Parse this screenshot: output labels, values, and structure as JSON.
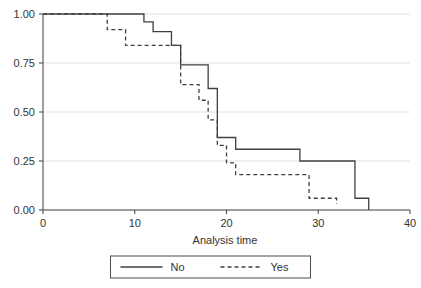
{
  "chart_data": {
    "type": "line",
    "subtype": "kaplan-meier-step",
    "title": "",
    "xlabel": "Analysis time",
    "ylabel": "",
    "xlim": [
      0,
      40
    ],
    "ylim": [
      0,
      1
    ],
    "xticks": [
      0,
      10,
      20,
      30,
      40
    ],
    "xticklabels": [
      "0",
      "10",
      "20",
      "30",
      "40"
    ],
    "yticks": [
      0.0,
      0.25,
      0.5,
      0.75,
      1.0
    ],
    "yticklabels": [
      "0.00",
      "0.25",
      "0.50",
      "0.75",
      "1.00"
    ],
    "grid": "horizontal",
    "legend_position": "below-center",
    "legend_entries": [
      "No",
      "Yes"
    ],
    "series": [
      {
        "name": "No",
        "style": "solid",
        "color": "#404040",
        "x": [
          0,
          11,
          12,
          14,
          15,
          18,
          19,
          21,
          28,
          34,
          35,
          35.5
        ],
        "y": [
          1.0,
          1.0,
          0.96,
          0.91,
          0.84,
          0.74,
          0.62,
          0.37,
          0.31,
          0.25,
          0.06,
          0.0
        ],
        "steps": [
          {
            "time": 0,
            "survival": 1.0
          },
          {
            "time": 11,
            "survival": 0.96
          },
          {
            "time": 12,
            "survival": 0.91
          },
          {
            "time": 14,
            "survival": 0.84
          },
          {
            "time": 15,
            "survival": 0.74
          },
          {
            "time": 18,
            "survival": 0.62
          },
          {
            "time": 19,
            "survival": 0.37
          },
          {
            "time": 21,
            "survival": 0.31
          },
          {
            "time": 28,
            "survival": 0.25
          },
          {
            "time": 34,
            "survival": 0.06
          },
          {
            "time": 35.5,
            "survival": 0.0
          }
        ]
      },
      {
        "name": "Yes",
        "style": "dashed",
        "color": "#404040",
        "x": [
          0,
          7,
          9,
          15,
          17,
          18,
          19,
          20,
          21,
          23,
          29,
          32
        ],
        "y": [
          1.0,
          1.0,
          0.92,
          0.84,
          0.64,
          0.56,
          0.46,
          0.33,
          0.24,
          0.18,
          0.18,
          0.06
        ],
        "steps": [
          {
            "time": 0,
            "survival": 1.0
          },
          {
            "time": 7,
            "survival": 0.92
          },
          {
            "time": 9,
            "survival": 0.84
          },
          {
            "time": 15,
            "survival": 0.64
          },
          {
            "time": 17,
            "survival": 0.56
          },
          {
            "time": 18,
            "survival": 0.46
          },
          {
            "time": 19,
            "survival": 0.33
          },
          {
            "time": 20,
            "survival": 0.24
          },
          {
            "time": 21,
            "survival": 0.18
          },
          {
            "time": 29,
            "survival": 0.06
          },
          {
            "time": 32,
            "survival": 0.03
          }
        ]
      }
    ]
  },
  "axes": {
    "x_title": "Analysis time"
  },
  "legend": {
    "items": [
      {
        "label": "No",
        "style": "solid"
      },
      {
        "label": "Yes",
        "style": "dashed"
      }
    ]
  },
  "colors": {
    "line": "#404040",
    "grid": "#d9d9d9",
    "axis": "#4d4d4d",
    "text": "#333333",
    "background": "#ffffff"
  }
}
